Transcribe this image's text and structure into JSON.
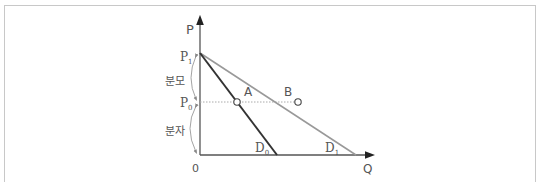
{
  "diagram": {
    "type": "demand-curves",
    "axes": {
      "y_label": "P",
      "x_label": "Q",
      "origin_label": "0"
    },
    "price_levels": [
      {
        "name": "P1",
        "base": "P",
        "sub": "1"
      },
      {
        "name": "P0",
        "base": "P",
        "sub": "0"
      }
    ],
    "brackets": [
      {
        "label": "분모",
        "from": "P1",
        "to": "P0"
      },
      {
        "label": "분자",
        "from": "P0",
        "to": "0"
      }
    ],
    "curves": [
      {
        "name": "D0",
        "base": "D",
        "sub": "0",
        "color": "#333333"
      },
      {
        "name": "D1",
        "base": "D",
        "sub": "1",
        "color": "#999999"
      }
    ],
    "points": [
      {
        "label": "A",
        "on": "D0",
        "at_price": "P0"
      },
      {
        "label": "B",
        "on": "D1",
        "at_price": "P0"
      }
    ]
  }
}
